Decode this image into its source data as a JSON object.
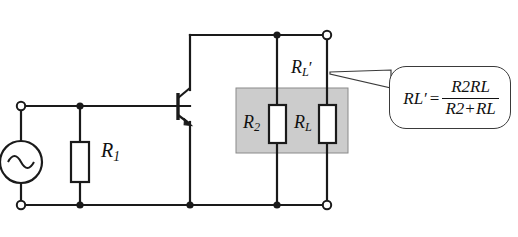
{
  "diagram": {
    "background_color": "#ffffff",
    "wire_color": "#1a1a1a",
    "shaded_box_color": "#cccccc"
  },
  "source": {
    "type": "ac-voltage-source",
    "symbol": "sine-wave"
  },
  "labels": {
    "r1": "R",
    "r1_sub": "1",
    "r2": "R",
    "r2_sub": "2",
    "rl": "R",
    "rl_sub": "L",
    "rl_prime": "R",
    "rl_prime_sub": "L",
    "rl_prime_mark": "′"
  },
  "formula": {
    "lhs_base": "R",
    "lhs_sub": "L",
    "lhs_prime": "′",
    "equals": "=",
    "numerator_a": "R",
    "numerator_a_sub": "2",
    "numerator_b": "R",
    "numerator_b_sub": "L",
    "denominator_a": "R",
    "denominator_a_sub": "2",
    "denominator_plus": "+",
    "denominator_b": "R",
    "denominator_b_sub": "L"
  },
  "components": {
    "transistor": "npn-bipolar-junction-transistor",
    "terminals": [
      "input-top-terminal",
      "input-bottom-terminal",
      "output-top-terminal",
      "output-bottom-terminal"
    ],
    "junction_dots": 6
  }
}
